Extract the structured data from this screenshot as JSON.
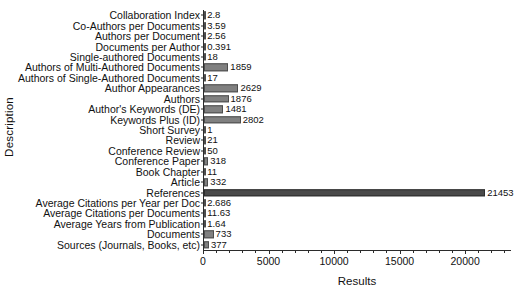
{
  "chart_data": {
    "type": "bar",
    "orientation": "horizontal",
    "title": "",
    "xlabel": "Results",
    "ylabel": "Description",
    "xlim": [
      0,
      23500
    ],
    "xticks": [
      0,
      5000,
      10000,
      15000,
      20000
    ],
    "xticklabels": [
      "0",
      "5000",
      "10000",
      "15000",
      "20000"
    ],
    "grid": false,
    "legend": null,
    "categories": [
      "Collaboration Index",
      "Co-Authors per Documents",
      "Authors per Document",
      "Documents per Author",
      "Single-authored Documents",
      "Authors of Multi-Authored Documents",
      "Authors of Single-Authored Documents",
      "Author Appearances",
      "Authors",
      "Author's Keywords (DE)",
      "Keywords Plus (ID)",
      "Short Survey",
      "Review",
      "Conference Review",
      "Conference Paper",
      "Book Chapter",
      "Article",
      "References",
      "Average Citations per Year per Doc",
      "Average Citations per Documents",
      "Average Years from Publication",
      "Documents",
      "Sources (Journals, Books, etc)"
    ],
    "values": [
      2.8,
      3.59,
      2.56,
      0.391,
      18,
      1859,
      17,
      2629,
      1876,
      1481,
      2802,
      1,
      21,
      50,
      318,
      11,
      332,
      21453,
      2.686,
      11.63,
      1.64,
      733,
      377
    ],
    "value_labels": [
      "2.8",
      "3.59",
      "2.56",
      "0.391",
      "18",
      "1859",
      "17",
      "2629",
      "1876",
      "1481",
      "2802",
      "1",
      "21",
      "50",
      "318",
      "11",
      "332",
      "21453",
      "2.686",
      "11.63",
      "1.64",
      "733",
      "377"
    ],
    "bar_color": "#808080",
    "bar_edge_color": "#4d4d4d",
    "highlight_bar": "References",
    "highlight_color": "#4a4a4a"
  }
}
